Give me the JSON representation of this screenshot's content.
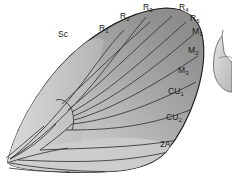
{
  "figure": {
    "background_color": "#ffffff",
    "wing": {
      "outline_color": "#1c1c1c",
      "fill_dark": "#8d8d8d",
      "fill_mid": "#a9a9a9",
      "fill_light": "#c8c8c8",
      "fill_lightest": "#d9d9d9",
      "vein_color": "#3a3a3a"
    },
    "secondary_shape": {
      "name": "hindwing-fragment",
      "fill": "#c9c9c9",
      "outline_color": "#4a4a4a"
    }
  },
  "labels": [
    {
      "id": "sc",
      "text": "Sc",
      "base": "Sc",
      "sub": "",
      "x": 58,
      "y": 30
    },
    {
      "id": "r1",
      "text": "R1",
      "base": "R",
      "sub": "1",
      "x": 99,
      "y": 24
    },
    {
      "id": "r2",
      "text": "R2",
      "base": "R",
      "sub": "2",
      "x": 120,
      "y": 12
    },
    {
      "id": "r3",
      "text": "R3",
      "base": "R",
      "sub": "3",
      "x": 143,
      "y": 3
    },
    {
      "id": "r4",
      "text": "R4",
      "base": "R",
      "sub": "4",
      "x": 179,
      "y": 3
    },
    {
      "id": "r5",
      "text": "R5",
      "base": "R",
      "sub": "5",
      "x": 190,
      "y": 14
    },
    {
      "id": "m1",
      "text": "M1",
      "base": "M",
      "sub": "1",
      "x": 192,
      "y": 27
    },
    {
      "id": "m2",
      "text": "M2",
      "base": "M",
      "sub": "2",
      "x": 188,
      "y": 46
    },
    {
      "id": "m3",
      "text": "M3",
      "base": "M",
      "sub": "3",
      "x": 178,
      "y": 66
    },
    {
      "id": "cu1",
      "text": "CU1",
      "base": "CU",
      "sub": "1",
      "x": 168,
      "y": 87
    },
    {
      "id": "cu2",
      "text": "CU2",
      "base": "CU",
      "sub": "2",
      "x": 166,
      "y": 113
    },
    {
      "id": "a2",
      "text": "2A",
      "base": "2A",
      "sub": "",
      "x": 160,
      "y": 140
    }
  ]
}
